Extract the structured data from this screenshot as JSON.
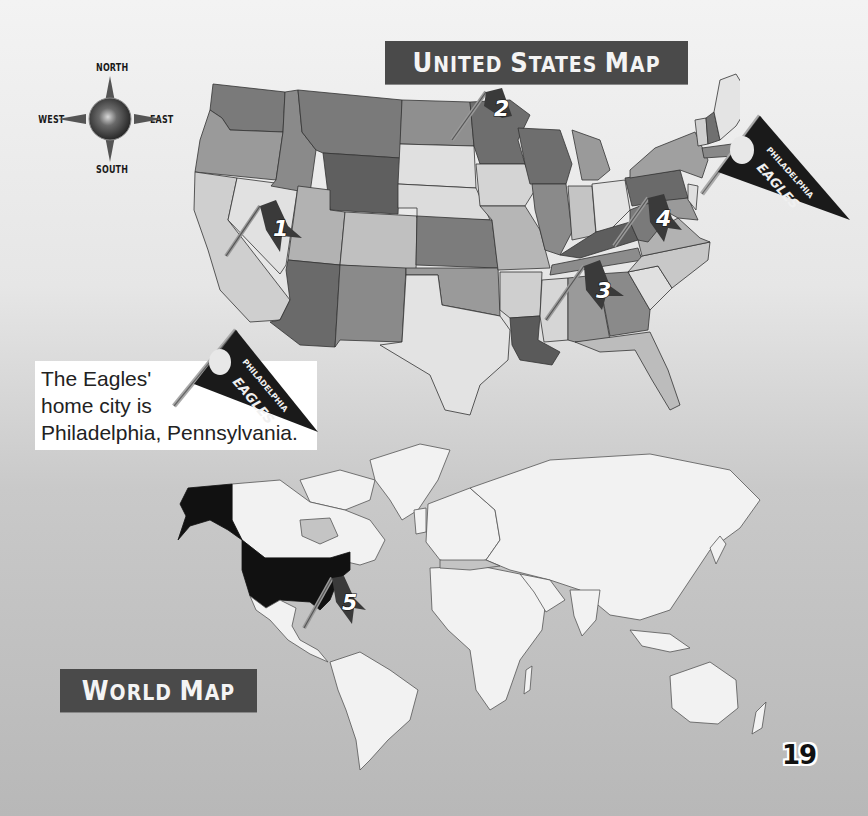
{
  "page": {
    "page_number": "19",
    "background": "gray gradient"
  },
  "compass": {
    "north": "NORTH",
    "south": "SOUTH",
    "east": "EAST",
    "west": "WEST",
    "icon": "compass-rose-icon"
  },
  "us_map": {
    "title": "United States Map",
    "title_display": {
      "first_cap": "U",
      "rest": "NITED ",
      "cap2": "S",
      "rest2": "TATES ",
      "cap3": "M",
      "rest3": "AP"
    },
    "flags": [
      {
        "number": "1",
        "location": "Nevada/Utah"
      },
      {
        "number": "2",
        "location": "Minnesota/North Dakota"
      },
      {
        "number": "3",
        "location": "Tennessee/Alabama"
      },
      {
        "number": "4",
        "location": "Pennsylvania/West Virginia"
      }
    ],
    "pennant": {
      "line1": "PHILADELPHIA",
      "line2": "EAGLES"
    }
  },
  "caption": {
    "line1": "The Eagles'",
    "line2": "home city is",
    "line3": "Philadelphia, Pennsylvania.",
    "pennant": {
      "line1": "PHILADELPHIA",
      "line2": "EAGLES"
    }
  },
  "world_map": {
    "title": "World Map",
    "title_display": {
      "first_cap": "W",
      "rest": "ORLD ",
      "cap2": "M",
      "rest2": "AP"
    },
    "highlighted_country": "United States",
    "flags": [
      {
        "number": "5",
        "location": "Gulf of Mexico"
      }
    ]
  },
  "colors": {
    "banner": "#4a4a4a",
    "flag": "#3a3a3a",
    "us_highlight": "#111111",
    "land": "#f2f2f2",
    "water": "#c4c4c4"
  }
}
